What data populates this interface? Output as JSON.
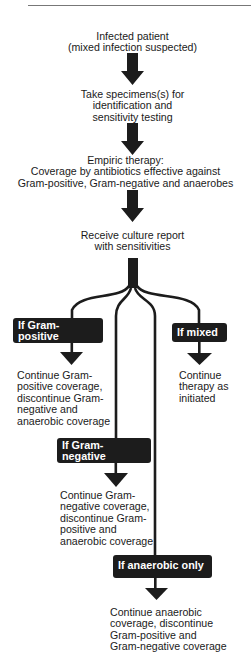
{
  "page": {
    "page_number_fragment": ""
  },
  "flowchart": {
    "steps": [
      {
        "id": "start",
        "lines": [
          "Infected patient",
          "(mixed infection suspected)"
        ]
      },
      {
        "id": "specimens",
        "lines": [
          "Take specimens(s) for",
          "identification and",
          "sensitivity testing"
        ]
      },
      {
        "id": "empiric",
        "lines": [
          "Empiric therapy:",
          "Coverage by antibiotics effective against",
          "Gram-positive, Gram-negative and anaerobes"
        ]
      },
      {
        "id": "culture",
        "lines": [
          "Receive culture report",
          "with sensitivities"
        ]
      }
    ],
    "branches": [
      {
        "id": "gram-positive",
        "condition": [
          "If Gram-positive",
          "only"
        ],
        "outcome": [
          "Continue Gram-",
          "positive coverage,",
          "discontinue Gram-",
          "negative and",
          "anaerobic coverage"
        ]
      },
      {
        "id": "mixed",
        "condition": [
          "If mixed"
        ],
        "outcome": [
          "Continue",
          "therapy as",
          "initiated"
        ]
      },
      {
        "id": "gram-negative",
        "condition": [
          "If Gram-negative",
          "only"
        ],
        "outcome": [
          "Continue Gram-",
          "negative coverage,",
          "discontinue Gram-",
          "positive and",
          "anaerobic coverage"
        ]
      },
      {
        "id": "anaerobic",
        "condition": [
          "If anaerobic only"
        ],
        "outcome": [
          "Continue anaerobic",
          "coverage, discontinue",
          "Gram-positive and",
          "Gram-negative coverage"
        ]
      }
    ]
  },
  "colors": {
    "ink": "#1c1c1c",
    "box_text": "#ffffff",
    "background": "#ffffff"
  }
}
